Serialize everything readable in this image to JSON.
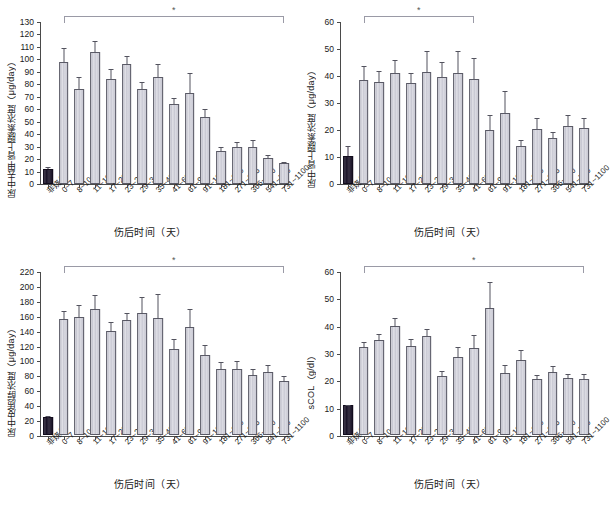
{
  "figure": {
    "xlabel": "伤后时间（天）",
    "significance_marker": "*",
    "categories": [
      "非烧伤",
      "0~7",
      "8~10",
      "11~16",
      "17~22",
      "23~28",
      "29~34",
      "35~40",
      "41~60",
      "61~90",
      "91~180",
      "181~270",
      "271~365",
      "366~540",
      "541~730",
      "731~1100"
    ],
    "colors": {
      "control_bar": "#1b1428",
      "bar": "#c3c3cf",
      "bar_outline": "#5a5a66",
      "axis": "#4a4a4a",
      "bracket": "#9a9aa6"
    }
  },
  "chart_data": [
    {
      "type": "bar",
      "panel": "top-left",
      "title": "",
      "ylabel": "尿中去甲肾上腺素浓度（μg/day）",
      "xlabel": "伤后时间（天）",
      "ylim": [
        0,
        130
      ],
      "yticks": [
        0,
        10,
        20,
        30,
        40,
        50,
        60,
        70,
        80,
        90,
        100,
        110,
        120,
        130
      ],
      "grid": false,
      "categories": [
        "非烧伤",
        "0~7",
        "8~10",
        "11~16",
        "17~22",
        "23~28",
        "29~34",
        "35~40",
        "41~60",
        "61~90",
        "91~180",
        "181~270",
        "271~365",
        "366~540",
        "541~730",
        "731~1100"
      ],
      "values": [
        12,
        98,
        76,
        106,
        84.5,
        96,
        76.5,
        85.5,
        64,
        73,
        53.5,
        26.5,
        29.5,
        29.5,
        20.5,
        16.5
      ],
      "errors": [
        1.5,
        11,
        9.5,
        9,
        7.5,
        7,
        5,
        10.5,
        5,
        16,
        7,
        3,
        4,
        6,
        2.5,
        1.5
      ],
      "annotation": {
        "marker": "*",
        "span": [
          "0~7",
          "731~1100"
        ]
      }
    },
    {
      "type": "bar",
      "panel": "top-right",
      "title": "",
      "ylabel": "尿中肾上腺素浓度（μg/day）",
      "xlabel": "伤后时间（天）",
      "ylim": [
        0,
        60
      ],
      "yticks": [
        0,
        10,
        20,
        30,
        40,
        50,
        60
      ],
      "grid": false,
      "categories": [
        "非烧伤",
        "0~7",
        "8~10",
        "11~16",
        "17~22",
        "23~28",
        "29~34",
        "35~40",
        "41~60",
        "61~90",
        "91~180",
        "181~270",
        "271~365",
        "366~540",
        "541~730",
        "731~1100"
      ],
      "values": [
        10.4,
        38.4,
        37.6,
        41.2,
        37.4,
        41.6,
        39.7,
        41.0,
        38.8,
        20.1,
        26.3,
        13.9,
        20.5,
        17.2,
        21.4,
        20.6
      ],
      "errors": [
        3.6,
        5.4,
        4.2,
        4.8,
        3.6,
        7.6,
        5.4,
        8.4,
        8.0,
        5.6,
        8.2,
        2.4,
        3.8,
        2.2,
        4.2,
        4.0
      ],
      "annotation": {
        "marker": "*",
        "span": [
          "0~7",
          "41~60"
        ]
      }
    },
    {
      "type": "bar",
      "panel": "bottom-left",
      "title": "",
      "ylabel": "尿中皮质醇浓度（μg/day）",
      "xlabel": "伤后时间（天）",
      "ylim": [
        0,
        220
      ],
      "yticks": [
        0,
        20,
        40,
        60,
        80,
        100,
        120,
        140,
        160,
        180,
        200,
        220
      ],
      "grid": false,
      "categories": [
        "非烧伤",
        "0~7",
        "8~10",
        "11~16",
        "17~22",
        "23~28",
        "29~34",
        "35~40",
        "41~60",
        "61~90",
        "91~180",
        "181~270",
        "271~365",
        "366~540",
        "541~730",
        "731~1100"
      ],
      "values": [
        24,
        156,
        158,
        169,
        140,
        154,
        164,
        157,
        116,
        145,
        108,
        89,
        88,
        80,
        84,
        73
      ],
      "errors": [
        3,
        12,
        18,
        20,
        13,
        11,
        22,
        34,
        14,
        26,
        14,
        10,
        13,
        10,
        11,
        7
      ],
      "annotation": {
        "marker": "*",
        "span": [
          "0~7",
          "731~1100"
        ]
      }
    },
    {
      "type": "bar",
      "panel": "bottom-right",
      "title": "",
      "ylabel": "sCOL（g/dl）",
      "xlabel": "伤后时间（天）",
      "ylim": [
        0,
        60
      ],
      "yticks": [
        0,
        10,
        20,
        30,
        40,
        50,
        60
      ],
      "grid": false,
      "categories": [
        "非烧伤",
        "0~7",
        "8~10",
        "11~16",
        "17~22",
        "23~28",
        "29~34",
        "35~40",
        "41~60",
        "61~90",
        "91~180",
        "181~270",
        "271~365",
        "366~540",
        "541~730",
        "731~1100"
      ],
      "values": [
        10.8,
        32.1,
        34.8,
        39.8,
        32.6,
        36.4,
        21.5,
        28.7,
        32.0,
        46.5,
        22.8,
        27.6,
        20.5,
        23.1,
        20.8,
        20.4
      ],
      "errors": [
        0.4,
        2.3,
        2.4,
        3.5,
        3.0,
        2.6,
        2.3,
        3.7,
        4.8,
        10.0,
        3.0,
        3.8,
        1.8,
        2.4,
        1.8,
        2.3
      ],
      "annotation": {
        "marker": "*",
        "span": [
          "0~7",
          "731~1100"
        ]
      }
    }
  ]
}
